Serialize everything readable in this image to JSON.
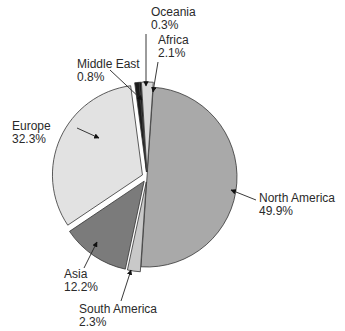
{
  "chart_data": {
    "type": "pie",
    "title": "",
    "categories": [
      "North America",
      "South America",
      "Asia",
      "Europe",
      "Middle East",
      "Oceania",
      "Africa"
    ],
    "values": [
      49.9,
      2.3,
      12.2,
      32.3,
      0.8,
      0.3,
      2.1
    ],
    "value_labels": [
      "49.9%",
      "2.3%",
      "12.2%",
      "32.3%",
      "0.8%",
      "0.3%",
      "2.1%"
    ],
    "colors": [
      "#a9a9a9",
      "#c9c9c9",
      "#7b7b7b",
      "#e2e2e2",
      "#1c1c1c",
      "#111111",
      "#d9d9d9"
    ],
    "exploded": [
      false,
      true,
      true,
      true,
      true,
      true,
      true
    ],
    "start_angle_deg": 4,
    "direction": "clockwise",
    "legend": "none",
    "data_labels": "outside with leader arrows"
  },
  "labels": {
    "north_america": {
      "name": "North America",
      "pct": "49.9%"
    },
    "south_america": {
      "name": "South America",
      "pct": "2.3%"
    },
    "asia": {
      "name": "Asia",
      "pct": "12.2%"
    },
    "europe": {
      "name": "Europe",
      "pct": "32.3%"
    },
    "middle_east": {
      "name": "Middle East",
      "pct": "0.8%"
    },
    "oceania": {
      "name": "Oceania",
      "pct": "0.3%"
    },
    "africa": {
      "name": "Africa",
      "pct": "2.1%"
    }
  }
}
